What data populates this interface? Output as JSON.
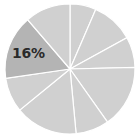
{
  "chart_data": {
    "type": "pie",
    "title": "",
    "center": [
      70,
      69
    ],
    "radius": 65,
    "start_angle_deg": 0,
    "direction": "clockwise",
    "slices": [
      {
        "value": 6.5,
        "color": "#d0d0d0",
        "label": ""
      },
      {
        "value": 10.5,
        "color": "#d0d0d0",
        "label": ""
      },
      {
        "value": 7.6,
        "color": "#d0d0d0",
        "label": ""
      },
      {
        "value": 15.6,
        "color": "#d0d0d0",
        "label": ""
      },
      {
        "value": 8.3,
        "color": "#d0d0d0",
        "label": ""
      },
      {
        "value": 15.6,
        "color": "#d0d0d0",
        "label": ""
      },
      {
        "value": 8.6,
        "color": "#d0d0d0",
        "label": ""
      },
      {
        "value": 16,
        "color": "#b4b4b4",
        "label": "16%",
        "highlighted": true
      },
      {
        "value": 11.3,
        "color": "#d0d0d0",
        "label": ""
      }
    ],
    "separator_color": "#ffffff",
    "legend": null
  },
  "labels": {
    "highlight": "16%"
  }
}
